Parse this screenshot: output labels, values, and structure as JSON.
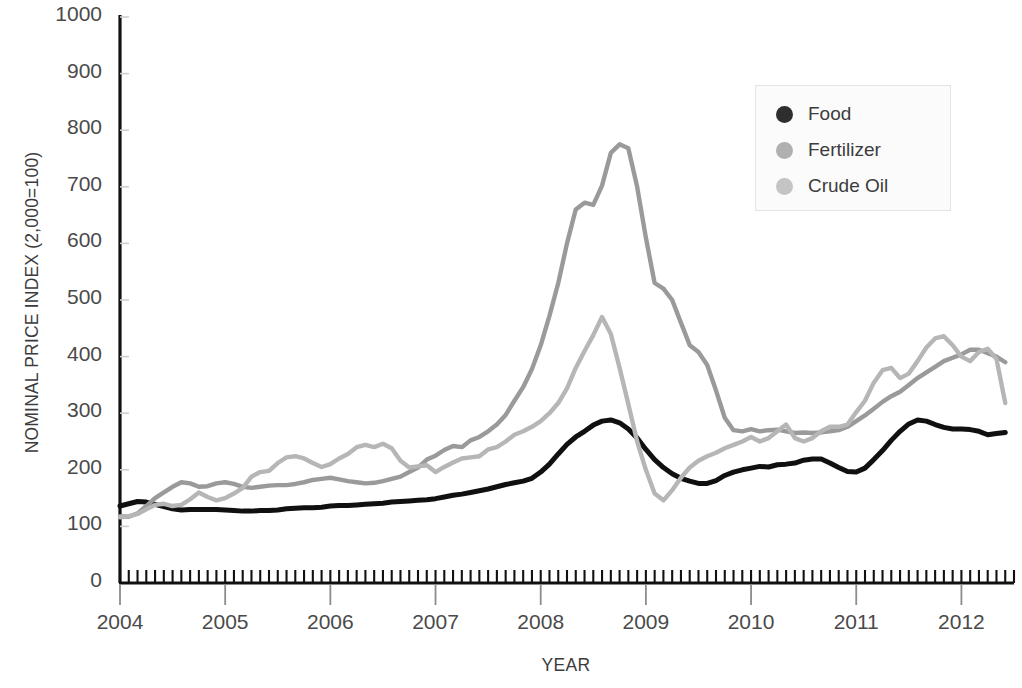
{
  "chart_data": {
    "type": "line",
    "title": "",
    "xlabel": "YEAR",
    "ylabel": "NOMINAL PRICE INDEX (2,000=100)",
    "xlim": [
      2004.0,
      2012.5
    ],
    "ylim": [
      0,
      1000
    ],
    "ytick_labels": [
      "0",
      "100",
      "200",
      "300",
      "400",
      "500",
      "600",
      "700",
      "800",
      "900",
      "1000"
    ],
    "ytick_values": [
      0,
      100,
      200,
      300,
      400,
      500,
      600,
      700,
      800,
      900,
      1000
    ],
    "xtick_labels": [
      "2004",
      "2005",
      "2006",
      "2007",
      "2008",
      "2009",
      "2010",
      "2011",
      "2012"
    ],
    "xtick_values": [
      2004,
      2005,
      2006,
      2007,
      2008,
      2009,
      2010,
      2011,
      2012
    ],
    "x_minor_tick_interval_months": 1,
    "grid": false,
    "legend_position": "top-right",
    "x": [
      2004.0,
      2004.083,
      2004.167,
      2004.25,
      2004.333,
      2004.417,
      2004.5,
      2004.583,
      2004.667,
      2004.75,
      2004.833,
      2004.917,
      2005.0,
      2005.083,
      2005.167,
      2005.25,
      2005.333,
      2005.417,
      2005.5,
      2005.583,
      2005.667,
      2005.75,
      2005.833,
      2005.917,
      2006.0,
      2006.083,
      2006.167,
      2006.25,
      2006.333,
      2006.417,
      2006.5,
      2006.583,
      2006.667,
      2006.75,
      2006.833,
      2006.917,
      2007.0,
      2007.083,
      2007.167,
      2007.25,
      2007.333,
      2007.417,
      2007.5,
      2007.583,
      2007.667,
      2007.75,
      2007.833,
      2007.917,
      2008.0,
      2008.083,
      2008.167,
      2008.25,
      2008.333,
      2008.417,
      2008.5,
      2008.583,
      2008.667,
      2008.75,
      2008.833,
      2008.917,
      2009.0,
      2009.083,
      2009.167,
      2009.25,
      2009.333,
      2009.417,
      2009.5,
      2009.583,
      2009.667,
      2009.75,
      2009.833,
      2009.917,
      2010.0,
      2010.083,
      2010.167,
      2010.25,
      2010.333,
      2010.417,
      2010.5,
      2010.583,
      2010.667,
      2010.75,
      2010.833,
      2010.917,
      2011.0,
      2011.083,
      2011.167,
      2011.25,
      2011.333,
      2011.417,
      2011.5,
      2011.583,
      2011.667,
      2011.75,
      2011.833,
      2011.917,
      2012.0,
      2012.083,
      2012.167,
      2012.25,
      2012.333,
      2012.417
    ],
    "series": [
      {
        "name": "Food",
        "color": "#101010",
        "marker": "circle",
        "values": [
          136,
          140,
          144,
          143,
          139,
          135,
          131,
          129,
          130,
          130,
          130,
          130,
          129,
          128,
          127,
          127,
          128,
          128,
          129,
          131,
          132,
          133,
          133,
          134,
          136,
          137,
          137,
          138,
          139,
          140,
          141,
          143,
          144,
          145,
          146,
          147,
          149,
          152,
          155,
          157,
          160,
          163,
          166,
          170,
          174,
          177,
          180,
          185,
          196,
          210,
          228,
          245,
          258,
          268,
          279,
          286,
          288,
          283,
          272,
          256,
          236,
          218,
          204,
          193,
          185,
          180,
          176,
          176,
          181,
          190,
          196,
          200,
          203,
          206,
          205,
          209,
          210,
          212,
          217,
          219,
          219,
          212,
          204,
          197,
          196,
          203,
          218,
          234,
          252,
          268,
          281,
          288,
          286,
          280,
          275,
          272,
          272,
          271,
          268,
          262,
          264,
          266
        ]
      },
      {
        "name": "Fertilizer",
        "color": "#9a9a9a",
        "marker": "circle",
        "values": [
          118,
          117,
          123,
          136,
          150,
          160,
          170,
          178,
          176,
          170,
          171,
          176,
          178,
          175,
          170,
          168,
          170,
          172,
          173,
          173,
          175,
          178,
          182,
          184,
          186,
          183,
          180,
          178,
          176,
          177,
          180,
          184,
          188,
          196,
          204,
          218,
          225,
          235,
          242,
          240,
          252,
          258,
          268,
          280,
          297,
          322,
          346,
          378,
          420,
          472,
          530,
          600,
          660,
          672,
          668,
          702,
          760,
          775,
          768,
          700,
          610,
          530,
          520,
          500,
          460,
          420,
          408,
          385,
          340,
          292,
          270,
          268,
          272,
          268,
          270,
          271,
          268,
          265,
          266,
          265,
          266,
          268,
          270,
          276,
          286,
          296,
          308,
          320,
          330,
          338,
          350,
          362,
          372,
          382,
          392,
          398,
          404,
          412,
          412,
          406,
          400,
          390
        ]
      },
      {
        "name": "Crude Oil",
        "color": "#b6b6b6",
        "marker": "circle",
        "values": [
          116,
          118,
          122,
          130,
          138,
          140,
          136,
          138,
          148,
          160,
          152,
          146,
          150,
          158,
          168,
          188,
          196,
          198,
          212,
          222,
          224,
          220,
          212,
          205,
          210,
          220,
          228,
          240,
          244,
          240,
          246,
          238,
          216,
          204,
          206,
          208,
          196,
          205,
          213,
          220,
          222,
          224,
          236,
          240,
          250,
          262,
          268,
          276,
          286,
          300,
          318,
          344,
          380,
          410,
          438,
          470,
          440,
          380,
          316,
          250,
          200,
          158,
          146,
          164,
          186,
          204,
          216,
          224,
          230,
          238,
          244,
          250,
          258,
          250,
          256,
          268,
          280,
          256,
          250,
          256,
          268,
          276,
          276,
          280,
          302,
          322,
          354,
          376,
          380,
          362,
          370,
          392,
          416,
          432,
          436,
          420,
          400,
          392,
          408,
          414,
          396,
          318
        ]
      }
    ]
  },
  "legend": {
    "items": [
      {
        "label": "Food",
        "color": "#2e2e2e"
      },
      {
        "label": "Fertilizer",
        "color": "#b0b0b0"
      },
      {
        "label": "Crude Oil",
        "color": "#c4c4c4"
      }
    ]
  },
  "axis_color": "#111111"
}
